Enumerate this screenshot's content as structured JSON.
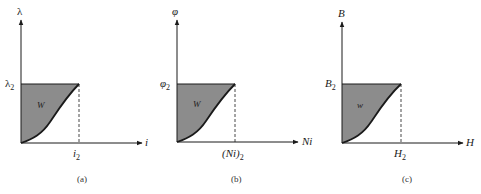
{
  "colors": {
    "fill": "#8c8c8c",
    "line": "#1a1a1a",
    "background": "#ffffff"
  },
  "panels": [
    {
      "id": "a",
      "y_axis_label": "λ",
      "y_level_label": "λ",
      "y_level_sub": "2",
      "x_axis_label": "i",
      "x_level_label": "i",
      "x_level_sub": "2",
      "area_label": "W",
      "caption": "(a)"
    },
    {
      "id": "b",
      "y_axis_label": "φ",
      "y_level_label": "φ",
      "y_level_sub": "2",
      "x_axis_label": "Ni",
      "x_level_label": "(Ni)",
      "x_level_sub": "2",
      "area_label": "W",
      "caption": "(b)"
    },
    {
      "id": "c",
      "y_axis_label": "B",
      "y_level_label": "B",
      "y_level_sub": "2",
      "x_axis_label": "H",
      "x_level_label": "H",
      "x_level_sub": "2",
      "area_label": "w",
      "caption": "(c)"
    }
  ]
}
